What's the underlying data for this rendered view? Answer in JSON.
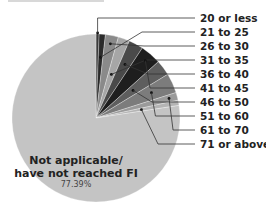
{
  "chart_data": {
    "type": "pie",
    "title": "",
    "start_angle_deg": 0,
    "direction": "clockwise",
    "slices": [
      {
        "label": "20 or less",
        "value": 0.6,
        "color": "#3a3a3a"
      },
      {
        "label": "21 to 25",
        "value": 1.2,
        "color": "#2b2b2b"
      },
      {
        "label": "26 to 30",
        "value": 2.5,
        "color": "#8a8a8a"
      },
      {
        "label": "31 to 35",
        "value": 2.2,
        "color": "#a6a6a6"
      },
      {
        "label": "36 to 40",
        "value": 2.8,
        "color": "#4a4a4a"
      },
      {
        "label": "41 to 45",
        "value": 4.0,
        "color": "#1e1e1e"
      },
      {
        "label": "46 to 50",
        "value": 3.0,
        "color": "#5e5e5e"
      },
      {
        "label": "51 to 60",
        "value": 3.8,
        "color": "#7c7c7c"
      },
      {
        "label": "61 to 70",
        "value": 1.5,
        "color": "#9a9a9a"
      },
      {
        "label": "71 or above",
        "value": 1.0,
        "color": "#b4b4b4"
      },
      {
        "label": "Not applicable/ have not reached FI",
        "value": 77.39,
        "color": "#c4c4c4"
      }
    ],
    "legend": [
      "20 or less",
      "21 to 25",
      "26 to 30",
      "31 to 35",
      "36 to 40",
      "41 to 45",
      "46 to 50",
      "51 to 60",
      "61 to 70",
      "71 or above"
    ],
    "legend_position": "right",
    "annotations": [
      {
        "text": "Not applicable/",
        "line": 1
      },
      {
        "text": "have not reached FI",
        "line": 2
      },
      {
        "text": "77.39%",
        "line": 3
      }
    ]
  },
  "labels": {
    "center_line1": "Not applicable/",
    "center_line2": "have not reached FI",
    "center_pct": "77.39%",
    "legend": [
      "20 or less",
      "21 to 25",
      "26 to 30",
      "31 to 35",
      "36 to 40",
      "41 to 45",
      "46 to 50",
      "51 to 60",
      "61 to 70",
      "71 or above"
    ]
  }
}
